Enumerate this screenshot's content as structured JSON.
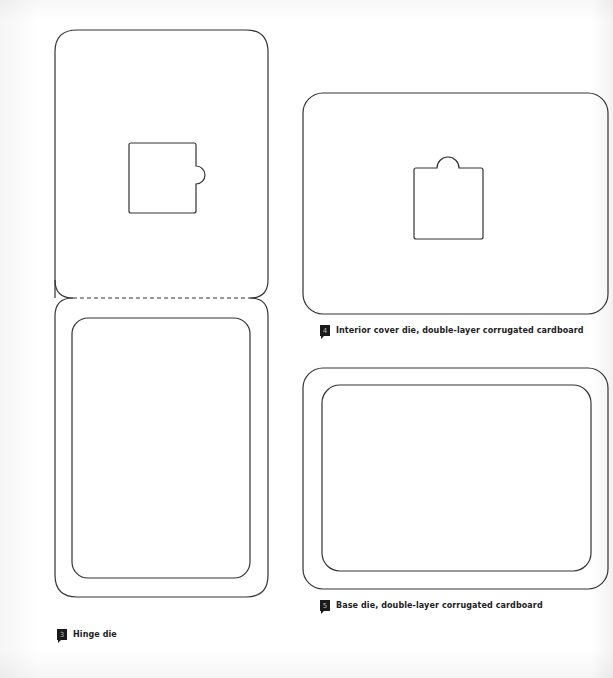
{
  "figures": [
    {
      "id": "hinge",
      "number": "3",
      "caption": "Hinge die"
    },
    {
      "id": "interior-cover",
      "number": "4",
      "caption": "Interior cover die, double-layer corrugated cardboard"
    },
    {
      "id": "base",
      "number": "5",
      "caption": "Base die, double-layer corrugated cardboard"
    }
  ],
  "colors": {
    "line": "#333333",
    "badge": "#1a1a1a"
  }
}
